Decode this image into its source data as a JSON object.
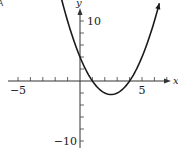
{
  "corner_label": "A",
  "chart_data": {
    "type": "line",
    "title": "",
    "function": "y = x^2 - 5x + 4",
    "xlabel": "x",
    "ylabel": "y",
    "xlim": [
      -6,
      7.5
    ],
    "ylim": [
      -11.5,
      13.5
    ],
    "grid": false,
    "x_ticks": [
      -5,
      -4,
      -3,
      -2,
      -1,
      1,
      2,
      3,
      4,
      5,
      6,
      7
    ],
    "x_tick_labels": {
      "-5": "−5",
      "5": "5"
    },
    "y_ticks": [
      -10,
      -8,
      -6,
      -4,
      -2,
      2,
      4,
      6,
      8,
      10
    ],
    "y_tick_labels": {
      "10": "10",
      "-10": "−10"
    },
    "series": [
      {
        "name": "parabola",
        "x": [
          -1.6,
          -1,
          0,
          1,
          2,
          2.5,
          3,
          4,
          5,
          6,
          6.4
        ],
        "y": [
          14.56,
          10,
          4,
          0,
          -2,
          -2.25,
          -2,
          0,
          4,
          10,
          12.96
        ]
      }
    ],
    "key_points": {
      "roots": [
        1,
        4
      ],
      "vertex": [
        2.5,
        -2.25
      ],
      "y_intercept": 4
    }
  },
  "layout": {
    "origin_px": [
      80,
      81
    ],
    "px_per_x_unit": 12.4,
    "px_per_y_unit": 6.0
  }
}
